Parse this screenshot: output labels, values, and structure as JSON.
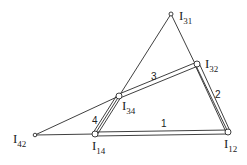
{
  "diagram": {
    "type": "four-bar linkage instant centers",
    "points": {
      "I31": {
        "x": 171,
        "y": 14
      },
      "I32": {
        "x": 197,
        "y": 64
      },
      "I34": {
        "x": 119,
        "y": 96
      },
      "I14": {
        "x": 95,
        "y": 134
      },
      "I12": {
        "x": 228,
        "y": 132
      },
      "I42": {
        "x": 35,
        "y": 135
      }
    },
    "labels": {
      "I31": {
        "main": "I",
        "sub": "31"
      },
      "I32": {
        "main": "I",
        "sub": "32"
      },
      "I34": {
        "main": "I",
        "sub": "34"
      },
      "I14": {
        "main": "I",
        "sub": "14"
      },
      "I12": {
        "main": "I",
        "sub": "12"
      },
      "I42": {
        "main": "I",
        "sub": "42"
      }
    },
    "links": {
      "link1": "1",
      "link2": "2",
      "link3": "3",
      "link4": "4"
    },
    "colors": {
      "line": "#2a2a2a",
      "background": "#ffffff"
    }
  }
}
